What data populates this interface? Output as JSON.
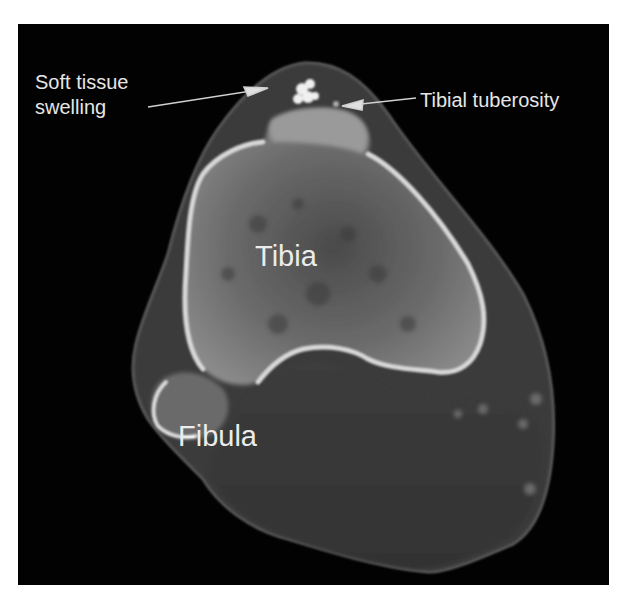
{
  "figure": {
    "background_color": "#ffffff",
    "panel_color": "#020202",
    "label_color": "#e6e6e6"
  },
  "annotations": {
    "soft_tissue": {
      "line1": "Soft tissue",
      "line2": "swelling"
    },
    "tuberosity": "Tibial tuberosity",
    "tibia": "Tibia",
    "fibula": "Fibula"
  },
  "icons": {
    "arrow_soft_tissue": "arrow-right-up",
    "arrow_tuberosity": "arrow-left"
  }
}
